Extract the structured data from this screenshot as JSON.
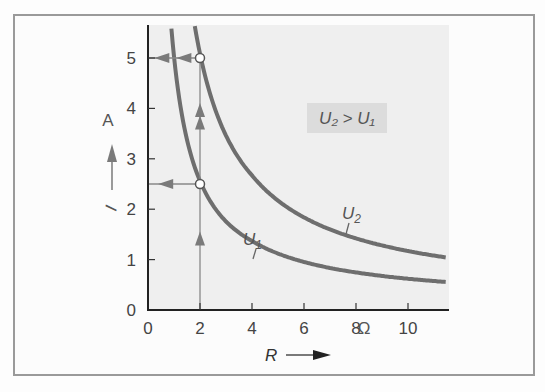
{
  "chart_data": {
    "type": "line",
    "title": "",
    "xlabel": "R",
    "ylabel": "I",
    "x_unit": "Ω",
    "y_unit": "A",
    "xlim": [
      0,
      11.5
    ],
    "ylim": [
      0,
      5.7
    ],
    "x_ticks": [
      0,
      2,
      4,
      6,
      8,
      10
    ],
    "y_ticks": [
      0,
      1,
      2,
      3,
      4,
      5
    ],
    "grid": false,
    "series": [
      {
        "name": "U1",
        "label": "U₁",
        "voltage_V": 5,
        "points": [
          [
            1.0,
            5.6
          ],
          [
            1.5,
            3.6
          ],
          [
            2,
            2.5
          ],
          [
            3,
            1.8
          ],
          [
            4,
            1.39
          ],
          [
            6,
            0.97
          ],
          [
            8,
            0.76
          ],
          [
            10,
            0.62
          ],
          [
            11.5,
            0.54
          ]
        ]
      },
      {
        "name": "U2",
        "label": "U₂",
        "voltage_V": 10,
        "points": [
          [
            2.0,
            5.7
          ],
          [
            2,
            5.0
          ],
          [
            3,
            3.4
          ],
          [
            3.5,
            2.98
          ],
          [
            4,
            2.7
          ],
          [
            6,
            1.85
          ],
          [
            7.6,
            1.5
          ],
          [
            10,
            1.2
          ],
          [
            11.5,
            1.07
          ]
        ]
      }
    ],
    "markers": [
      {
        "R": 2,
        "I": 5,
        "curve": "U2"
      },
      {
        "R": 2,
        "I": 2.5,
        "curve": "U1"
      }
    ],
    "annotation": "U₂ > U₁"
  },
  "labels": {
    "x_axis": "R",
    "y_axis": "I",
    "x_unit": "Ω",
    "y_unit": "A",
    "u1": "U",
    "u1_sub": "1",
    "u2": "U",
    "u2_sub": "2",
    "legend_box": "U₂ > U₁"
  }
}
